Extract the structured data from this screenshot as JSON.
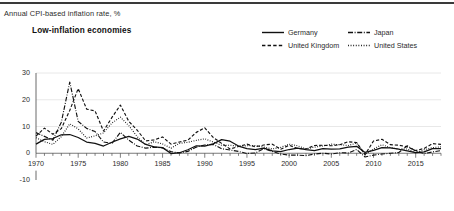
{
  "header": {
    "axis_note": "Annual CPI-based inflation rate, %",
    "panel_title": "Low-inflation economies"
  },
  "legend": {
    "position": "top-right",
    "items": [
      {
        "label": "Germany",
        "style": "solid",
        "color": "#111111"
      },
      {
        "label": "Japan",
        "style": "dashdot",
        "color": "#111111"
      },
      {
        "label": "United Kingdom",
        "style": "dashed",
        "color": "#111111"
      },
      {
        "label": "United States",
        "style": "dotted",
        "color": "#111111"
      }
    ]
  },
  "chart_data": {
    "type": "line",
    "title": "Low-inflation economies",
    "subtitle": "Annual CPI-based inflation rate, %",
    "xlabel": "",
    "ylabel": "Annual CPI-based inflation rate, %",
    "xlim": [
      1970,
      2018
    ],
    "ylim": [
      -10,
      30
    ],
    "yticks": [
      -10,
      0,
      10,
      20,
      30
    ],
    "xticks": [
      1970,
      1975,
      1980,
      1985,
      1990,
      1995,
      2000,
      2005,
      2010,
      2015
    ],
    "xtick_minor_step": 1,
    "grid": "horizontal-light",
    "legend_position": "top-right",
    "x": [
      1970,
      1971,
      1972,
      1973,
      1974,
      1975,
      1976,
      1977,
      1978,
      1979,
      1980,
      1981,
      1982,
      1983,
      1984,
      1985,
      1986,
      1987,
      1988,
      1989,
      1990,
      1991,
      1992,
      1993,
      1994,
      1995,
      1996,
      1997,
      1998,
      1999,
      2000,
      2001,
      2002,
      2003,
      2004,
      2005,
      2006,
      2007,
      2008,
      2009,
      2010,
      2011,
      2012,
      2013,
      2014,
      2015,
      2016,
      2017,
      2018
    ],
    "series": [
      {
        "name": "Germany",
        "style": "solid",
        "color": "#111111",
        "values": [
          3.4,
          5.2,
          5.5,
          6.9,
          7.0,
          5.9,
          4.2,
          3.7,
          2.7,
          4.1,
          5.4,
          6.3,
          5.3,
          3.3,
          2.4,
          2.1,
          -0.1,
          0.2,
          1.3,
          2.8,
          2.7,
          3.5,
          5.1,
          4.5,
          2.7,
          1.7,
          1.4,
          1.9,
          0.9,
          0.6,
          1.4,
          1.9,
          1.4,
          1.0,
          1.7,
          1.5,
          1.6,
          2.3,
          2.6,
          0.3,
          1.1,
          2.1,
          2.0,
          1.5,
          0.9,
          0.2,
          0.5,
          1.7,
          1.7
        ]
      },
      {
        "name": "Japan",
        "style": "dashdot",
        "color": "#111111",
        "values": [
          7.7,
          6.3,
          4.9,
          11.6,
          26.6,
          11.9,
          9.3,
          8.1,
          4.2,
          3.7,
          7.8,
          4.9,
          2.7,
          1.9,
          2.3,
          2.0,
          0.6,
          0.1,
          0.7,
          2.3,
          3.1,
          3.3,
          1.7,
          1.2,
          0.7,
          -0.1,
          0.1,
          1.7,
          0.7,
          -0.3,
          -0.7,
          -0.7,
          -0.9,
          -0.3,
          0.0,
          -0.3,
          0.2,
          0.1,
          1.4,
          -1.4,
          -0.7,
          -0.3,
          0.0,
          0.3,
          2.8,
          0.8,
          -0.1,
          0.5,
          1.0
        ]
      },
      {
        "name": "United Kingdom",
        "style": "dashed",
        "color": "#111111",
        "values": [
          6.4,
          9.4,
          7.1,
          9.2,
          16.0,
          24.2,
          16.5,
          15.8,
          8.3,
          13.4,
          18.0,
          11.9,
          8.6,
          4.6,
          5.0,
          6.1,
          3.4,
          4.2,
          4.9,
          7.8,
          9.5,
          5.9,
          3.7,
          1.6,
          2.5,
          3.4,
          2.4,
          3.1,
          3.4,
          1.5,
          3.0,
          1.8,
          1.6,
          2.9,
          3.0,
          2.8,
          3.2,
          4.3,
          4.0,
          -0.5,
          4.6,
          5.2,
          3.2,
          3.0,
          2.4,
          1.0,
          1.8,
          3.6,
          3.3
        ]
      },
      {
        "name": "United States",
        "style": "dotted",
        "color": "#111111",
        "values": [
          5.8,
          4.3,
          3.3,
          6.2,
          11.0,
          9.1,
          5.7,
          6.5,
          7.6,
          11.3,
          13.5,
          10.3,
          6.2,
          3.2,
          4.3,
          3.5,
          1.9,
          3.7,
          4.1,
          4.8,
          5.4,
          4.2,
          3.0,
          3.0,
          2.6,
          2.8,
          2.9,
          2.3,
          1.6,
          2.2,
          3.4,
          2.8,
          1.6,
          2.3,
          2.7,
          3.4,
          3.2,
          2.9,
          3.8,
          -0.4,
          1.6,
          3.2,
          2.1,
          1.5,
          1.6,
          0.1,
          1.3,
          2.1,
          2.4
        ]
      }
    ]
  }
}
